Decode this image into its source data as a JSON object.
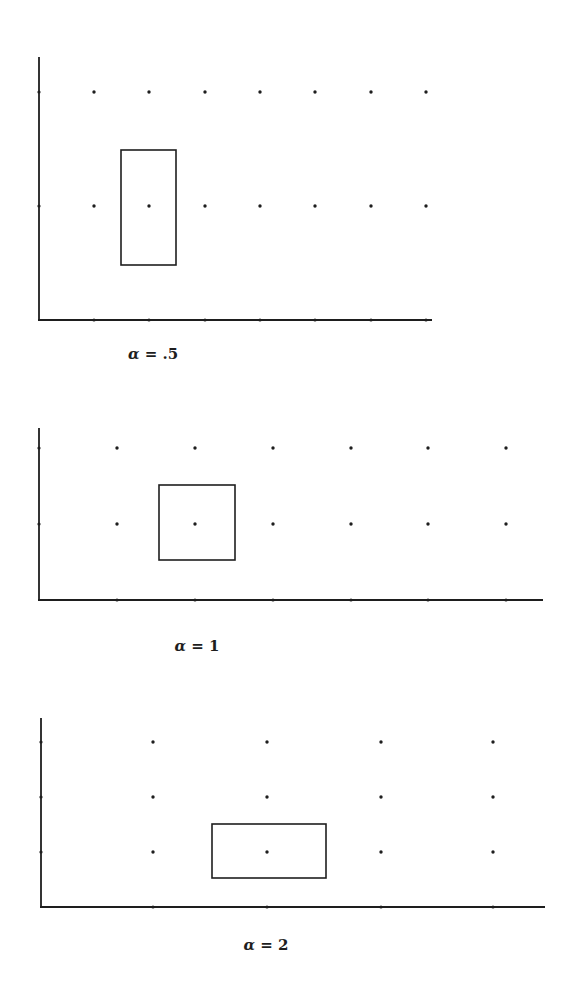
{
  "figure": {
    "ink_color": "#1e1e1e",
    "background": "#ffffff",
    "panels": [
      {
        "id": "alpha-0-5",
        "label_symbol": "α",
        "label_eq": " = ",
        "label_value": ".5",
        "label_pos": [
          153,
          354
        ],
        "origin": [
          39,
          320
        ],
        "axis_y_top": 57,
        "axis_x_end": 432,
        "dots_x": [
          94,
          149,
          205,
          260,
          315,
          371,
          426
        ],
        "dots_y": [
          92,
          206
        ],
        "rect": {
          "x": 121,
          "y": 150,
          "w": 55,
          "h": 115
        }
      },
      {
        "id": "alpha-1",
        "label_symbol": "α",
        "label_eq": " = ",
        "label_value": "1",
        "label_pos": [
          197,
          646
        ],
        "origin": [
          39,
          600
        ],
        "axis_y_top": 428,
        "axis_x_end": 543,
        "dots_x": [
          117,
          195,
          273,
          351,
          428,
          506
        ],
        "dots_y": [
          448,
          524
        ],
        "rect": {
          "x": 159,
          "y": 485,
          "w": 76,
          "h": 75
        }
      },
      {
        "id": "alpha-2",
        "label_symbol": "α",
        "label_eq": " = ",
        "label_value": "2",
        "label_pos": [
          266,
          945
        ],
        "origin": [
          41,
          907
        ],
        "axis_y_top": 718,
        "axis_x_end": 545,
        "dots_x": [
          153,
          267,
          381,
          493
        ],
        "dots_y": [
          742,
          797,
          852
        ],
        "rect": {
          "x": 212,
          "y": 824,
          "w": 114,
          "h": 54
        }
      }
    ]
  }
}
